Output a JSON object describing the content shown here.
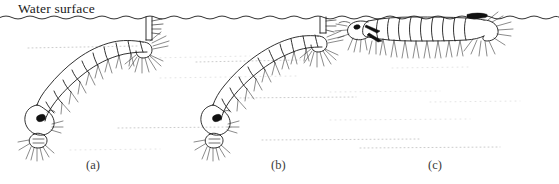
{
  "figure": {
    "title_label": "Water surface",
    "background_color": "#ffffff",
    "ink_color": "#1b1b1b",
    "width_px": 559,
    "height_px": 184,
    "panels": [
      {
        "id": "a",
        "label": "(a)",
        "label_x": 93,
        "label_y": 168,
        "subject": "mosquito-larva-hanging-head-down-long-siphon",
        "orientation": "head-down, oblique to surface",
        "siphon": "long breathing tube contacting water surface",
        "segments": 9,
        "features": [
          "dark eye spot",
          "mouth brushes",
          "lateral setae tufts",
          "anal papillae",
          "caudal brush"
        ]
      },
      {
        "id": "b",
        "label": "(b)",
        "label_x": 278,
        "label_y": 168,
        "subject": "mosquito-larva-hanging-head-down-short-siphon",
        "orientation": "head-down, oblique to surface",
        "siphon": "short breathing tube contacting water surface",
        "segments": 9,
        "features": [
          "dark eye spot",
          "mouth brushes",
          "lateral setae tufts",
          "anal papillae",
          "caudal brush"
        ]
      },
      {
        "id": "c",
        "label": "(c)",
        "label_x": 435,
        "label_y": 168,
        "subject": "mosquito-larva-lying-parallel-to-surface",
        "orientation": "horizontal, body parallel to and flush with water surface",
        "siphon": "no siphon; spiracular plate flush with surface",
        "segments": 9,
        "features": [
          "dark spiracular plate",
          "palmate float hairs",
          "head rotated",
          "mouth brushes",
          "caudal brush"
        ]
      }
    ],
    "water_surface": {
      "name": "water-surface-line",
      "style": "wavy meniscus line across full width",
      "y_px": 17
    }
  }
}
